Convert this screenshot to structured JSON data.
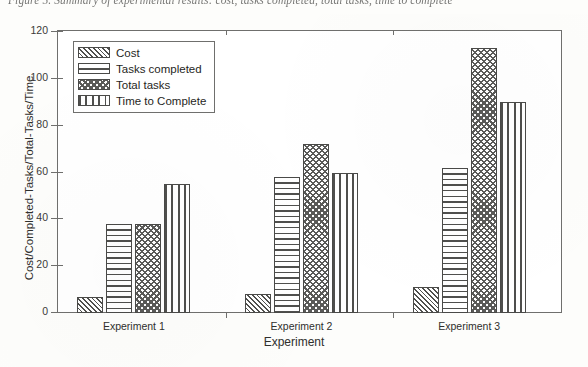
{
  "caption": "Figure 5. Summary of experimental results: cost, tasks completed, total tasks, time to complete",
  "chart_data": {
    "type": "bar",
    "title": "",
    "xlabel": "Experiment",
    "ylabel": "Cost/Completed-Tasks/Total-Tasks/Time",
    "categories": [
      "Experiment  1",
      "Experiment  2",
      "Experiment 3"
    ],
    "series": [
      {
        "name": "Cost",
        "pattern": "diagonal-hatch",
        "values": [
          7,
          8,
          11
        ]
      },
      {
        "name": "Tasks completed",
        "pattern": "horizontal-lines",
        "values": [
          38,
          58,
          62
        ]
      },
      {
        "name": "Total tasks",
        "pattern": "cross-hatch",
        "values": [
          38,
          72,
          113
        ]
      },
      {
        "name": "Time to Complete",
        "pattern": "square-dots",
        "values": [
          55,
          60,
          90
        ]
      }
    ],
    "ylim": [
      0,
      120
    ],
    "yticks": [
      0,
      20,
      40,
      60,
      80,
      100,
      120
    ],
    "grid": false,
    "legend_position": "top-left"
  },
  "colors": {
    "axis": "#6f6f6d",
    "bar_edge": "#4a4a48",
    "hatch": "#4f4f4d",
    "text": "#2f2f2d",
    "background": "#ffffff"
  }
}
